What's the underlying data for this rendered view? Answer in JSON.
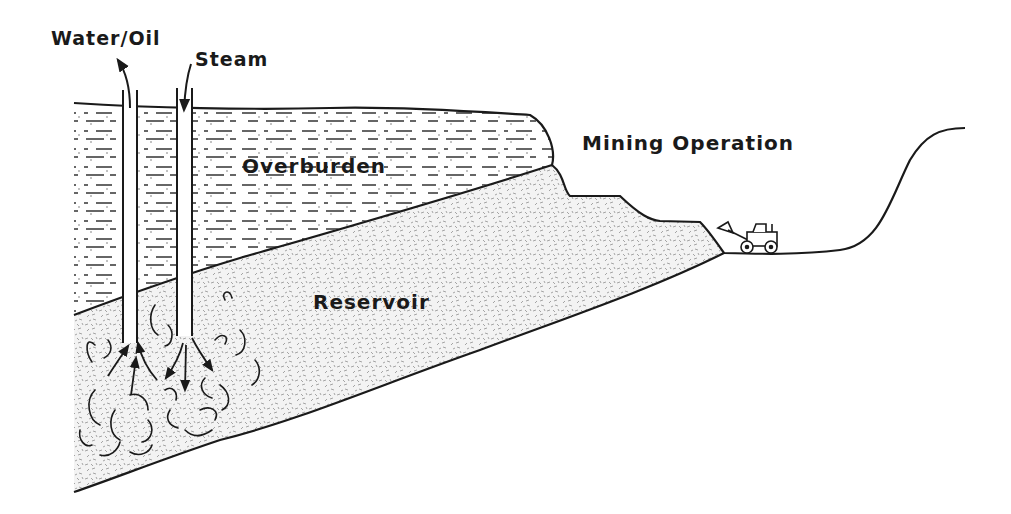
{
  "diagram": {
    "labels": {
      "water_oil": "Water/Oil",
      "steam": "Steam",
      "overburden": "Overburden",
      "mining_operation": "Mining Operation",
      "reservoir": "Reservoir"
    },
    "colors": {
      "ink": "#1a1a1a",
      "background": "#ffffff",
      "reservoir_stipple": "#9a9a9a"
    },
    "icons": {
      "production_well": "well-pipe",
      "injection_well": "well-pipe",
      "loader": "front-end-loader-icon"
    }
  }
}
